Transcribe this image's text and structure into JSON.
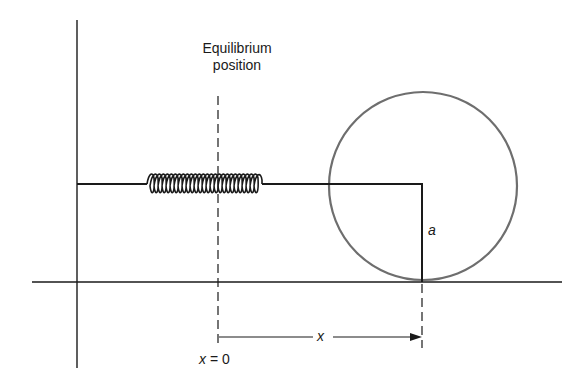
{
  "diagram": {
    "labels": {
      "equilibrium_line1": "Equilibrium",
      "equilibrium_line2": "position",
      "radius": "a",
      "displacement": "x",
      "origin_left": "x",
      "origin_eq": "=",
      "origin_val": "0"
    },
    "colors": {
      "line": "#1a1a1a",
      "circle": "#6e6e6e",
      "background": "#ffffff"
    },
    "geometry": {
      "wall_x": 77,
      "ground_y": 282,
      "circle_center": [
        423,
        186
      ],
      "circle_radius": 94,
      "rod_y": 184,
      "spring_start_x": 145,
      "spring_end_x": 262,
      "spring_coils": 18,
      "equilibrium_x": 218,
      "displacement_end_x": 422,
      "arrow_y": 337
    }
  }
}
